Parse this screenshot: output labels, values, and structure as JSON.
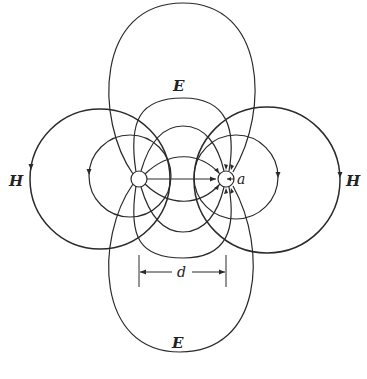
{
  "diagram": {
    "labels": {
      "e_top": "E",
      "e_bottom": "E",
      "h_left": "H",
      "h_right": "H",
      "radius": "a",
      "separation": "d"
    },
    "conductors": [
      {
        "name": "left-conductor",
        "cx": 139,
        "cy": 179,
        "r": 8
      },
      {
        "name": "right-conductor",
        "cx": 226,
        "cy": 179,
        "r": 8
      }
    ],
    "colors": {
      "line": "#2a2a2a",
      "background": "#ffffff"
    }
  }
}
